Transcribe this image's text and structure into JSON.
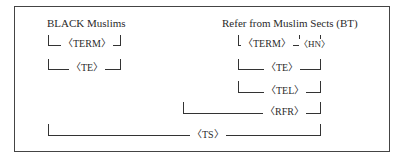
{
  "left_term": "BLACK Muslims",
  "right_term": "Refer from Muslim Sects (BT)",
  "relations": {
    "term": "〈TERM〉",
    "te": "〈TE〉",
    "hn": "〈HN〉",
    "te_right": "〈TE〉",
    "tel": "〈TEL〉",
    "rfr": "〈RFR〉",
    "ts": "〈TS〉"
  }
}
